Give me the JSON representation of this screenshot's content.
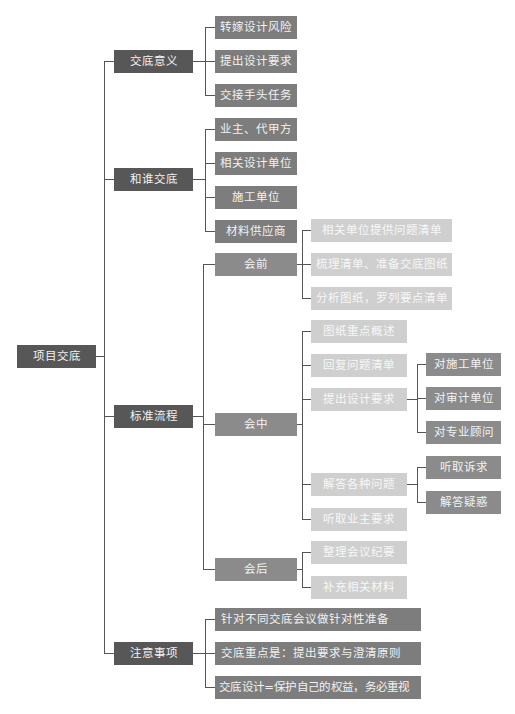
{
  "root": {
    "label": "项目交底"
  },
  "branches": [
    {
      "label": "交底意义",
      "children": [
        {
          "label": "转嫁设计风险"
        },
        {
          "label": "提出设计要求"
        },
        {
          "label": "交接手头任务"
        }
      ]
    },
    {
      "label": "和谁交底",
      "children": [
        {
          "label": "业主、代甲方"
        },
        {
          "label": "相关设计单位"
        },
        {
          "label": "施工单位"
        },
        {
          "label": "材料供应商"
        }
      ]
    },
    {
      "label": "标准流程",
      "children": [
        {
          "label": "会前",
          "children": [
            {
              "label": "相关单位提供问题清单"
            },
            {
              "label": "梳理清单、准备交底图纸"
            },
            {
              "label": "分析图纸，罗列要点清单"
            }
          ]
        },
        {
          "label": "会中",
          "children": [
            {
              "label": "图纸重点概述"
            },
            {
              "label": "回复问题清单"
            },
            {
              "label": "提出设计要求",
              "children": [
                {
                  "label": "对施工单位"
                },
                {
                  "label": "对审计单位"
                },
                {
                  "label": "对专业顾问"
                }
              ]
            },
            {
              "label": "解答各种问题",
              "children": [
                {
                  "label": "听取诉求"
                },
                {
                  "label": "解答疑惑"
                }
              ]
            },
            {
              "label": "听取业主要求"
            }
          ]
        },
        {
          "label": "会后",
          "children": [
            {
              "label": "整理会议纪要"
            },
            {
              "label": "补充相关材料"
            }
          ]
        }
      ]
    },
    {
      "label": "注意事项",
      "children": [
        {
          "label": "针对不同交底会议做针对性准备"
        },
        {
          "label": "交底重点是：提出要求与澄清原则"
        },
        {
          "label": "交底设计=保护自己的权益，务必重视"
        }
      ]
    }
  ],
  "colors": {
    "level1": "#575757",
    "level2": "#7d7d7d",
    "stage": "#8b8b8b",
    "light": "#cfcfcf",
    "connector": "#555555"
  }
}
